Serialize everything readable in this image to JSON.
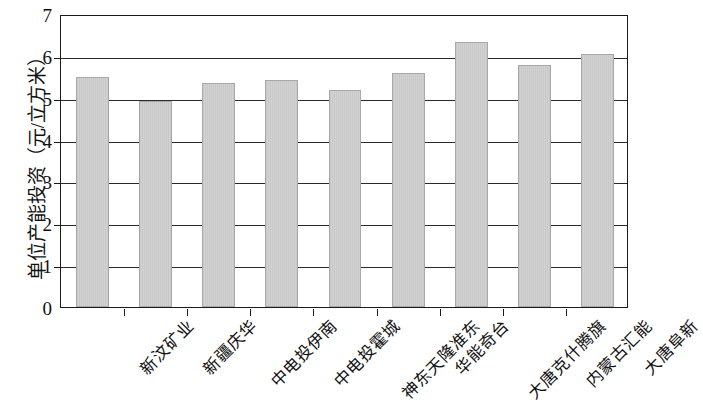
{
  "chart_data": {
    "type": "bar",
    "title": "",
    "xlabel": "",
    "ylabel": "单位产能投资（元/立方米）",
    "ylim": [
      0,
      7
    ],
    "y_ticks": [
      0,
      1,
      2,
      3,
      4,
      5,
      6,
      7
    ],
    "grid": true,
    "legend": null,
    "bar_color": "#cccccc",
    "bar_edge_color": "#a8a8a8",
    "axis_color": "#1a1a1a",
    "categories": [
      "新汶矿业",
      "新疆庆华",
      "中电投伊南",
      "中电投霍城",
      "神东天隆准东",
      "华能奇台",
      "大唐克什腾旗",
      "内蒙古汇能",
      "大唐阜新"
    ],
    "values": [
      5.5,
      4.92,
      5.35,
      5.42,
      5.18,
      5.58,
      6.33,
      5.78,
      6.05
    ]
  }
}
